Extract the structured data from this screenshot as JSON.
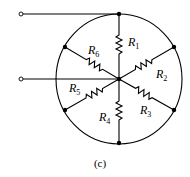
{
  "diagram": {
    "type": "resistor-network",
    "caption": "(c)",
    "resistors": [
      {
        "name": "R1",
        "letter": "R",
        "sub": "1",
        "from": "center",
        "to": "top-node"
      },
      {
        "name": "R2",
        "letter": "R",
        "sub": "2",
        "from": "center",
        "to": "upper-right-node"
      },
      {
        "name": "R3",
        "letter": "R",
        "sub": "3",
        "from": "center",
        "to": "lower-right-node"
      },
      {
        "name": "R4",
        "letter": "R",
        "sub": "4",
        "from": "center",
        "to": "bottom-node"
      },
      {
        "name": "R5",
        "letter": "R",
        "sub": "5",
        "from": "center",
        "to": "lower-left-node"
      },
      {
        "name": "R6",
        "letter": "R",
        "sub": "6",
        "from": "center",
        "to": "upper-left-node"
      }
    ],
    "terminals": [
      {
        "name": "terminal-a",
        "connects_to": "top-node"
      },
      {
        "name": "terminal-b",
        "connects_to": "center"
      }
    ],
    "colors": {
      "line": "#000000",
      "background": "#ffffff"
    }
  }
}
